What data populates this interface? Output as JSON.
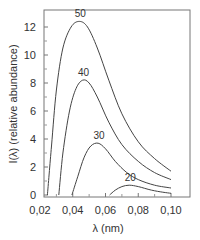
{
  "chart_data": {
    "type": "line",
    "title": "",
    "xlabel": "λ (nm)",
    "ylabel": "I(λ) (relative abundance)",
    "xlim": [
      0.022,
      0.111
    ],
    "ylim": [
      -0.1,
      13.0
    ],
    "x_ticks": [
      0.02,
      0.04,
      0.06,
      0.08,
      0.1
    ],
    "x_tick_labels": [
      "0,02",
      "0,04",
      "0,06",
      "0,08",
      "0,10"
    ],
    "y_ticks": [
      0,
      2,
      4,
      6,
      8,
      10,
      12
    ],
    "y_tick_labels": [
      "0",
      "2",
      "4",
      "6",
      "8",
      "10",
      "12"
    ],
    "grid": false,
    "legend": "inline curve labels",
    "series": [
      {
        "name": "50",
        "label": "50",
        "points": [
          [
            0.0245,
            0
          ],
          [
            0.027,
            3.5
          ],
          [
            0.03,
            7.5
          ],
          [
            0.034,
            10.5
          ],
          [
            0.039,
            12.0
          ],
          [
            0.044,
            12.4
          ],
          [
            0.049,
            12.0
          ],
          [
            0.055,
            10.5
          ],
          [
            0.062,
            8.2
          ],
          [
            0.07,
            5.8
          ],
          [
            0.08,
            3.8
          ],
          [
            0.09,
            2.6
          ],
          [
            0.1,
            1.7
          ]
        ]
      },
      {
        "name": "40",
        "label": "40",
        "points": [
          [
            0.0315,
            0
          ],
          [
            0.034,
            3.0
          ],
          [
            0.038,
            6.0
          ],
          [
            0.042,
            7.6
          ],
          [
            0.046,
            8.2
          ],
          [
            0.05,
            8.0
          ],
          [
            0.055,
            7.0
          ],
          [
            0.062,
            5.2
          ],
          [
            0.07,
            3.6
          ],
          [
            0.08,
            2.4
          ],
          [
            0.09,
            1.6
          ],
          [
            0.1,
            1.1
          ]
        ]
      },
      {
        "name": "30",
        "label": "30",
        "points": [
          [
            0.0395,
            0
          ],
          [
            0.043,
            1.3
          ],
          [
            0.047,
            2.7
          ],
          [
            0.051,
            3.5
          ],
          [
            0.0555,
            3.7
          ],
          [
            0.06,
            3.3
          ],
          [
            0.066,
            2.4
          ],
          [
            0.073,
            1.6
          ],
          [
            0.08,
            1.1
          ],
          [
            0.09,
            0.7
          ],
          [
            0.1,
            0.5
          ]
        ]
      },
      {
        "name": "20",
        "label": "20",
        "points": [
          [
            0.0625,
            0
          ],
          [
            0.066,
            0.35
          ],
          [
            0.07,
            0.6
          ],
          [
            0.0745,
            0.7
          ],
          [
            0.08,
            0.6
          ],
          [
            0.088,
            0.35
          ],
          [
            0.095,
            0.2
          ],
          [
            0.1,
            0.12
          ]
        ]
      }
    ]
  },
  "axes": {
    "x_label": "λ (nm)",
    "y_label": "I(λ) (relative abundance)"
  },
  "colors": {
    "line": "#444444",
    "frame": "#777777",
    "text": "#333333"
  }
}
